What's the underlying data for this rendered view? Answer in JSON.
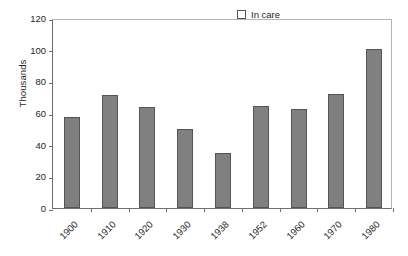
{
  "chart_data": {
    "type": "bar",
    "title": "",
    "subtitle": "",
    "xlabel": "",
    "ylabel": "Thousands",
    "categories": [
      "1900",
      "1910",
      "1920",
      "1930",
      "1938",
      "1952",
      "1960",
      "1970",
      "1980"
    ],
    "series": [
      {
        "name": "In care",
        "values": [
          57.5,
          71.5,
          63.5,
          50.0,
          34.5,
          64.5,
          62.5,
          72.0,
          100.5
        ]
      }
    ],
    "values": [
      57.5,
      71.5,
      63.5,
      50.0,
      34.5,
      64.5,
      62.5,
      72.0,
      100.5
    ],
    "ylim": [
      0,
      120
    ],
    "ytick_values": [
      0,
      20,
      40,
      60,
      80,
      100,
      120
    ],
    "ytick_labels": [
      "0",
      "20",
      "40",
      "60",
      "80",
      "100",
      "120"
    ],
    "grid": false,
    "legend_position": "top-right",
    "xtick_rotation": -45,
    "bar_color": "#808080",
    "bar_edge_color": "#555555",
    "axis_color": "#6e6e6e",
    "background_color": "#ffffff"
  },
  "legend": {
    "entries": [
      {
        "label": "In care",
        "color": "#808080"
      }
    ]
  }
}
